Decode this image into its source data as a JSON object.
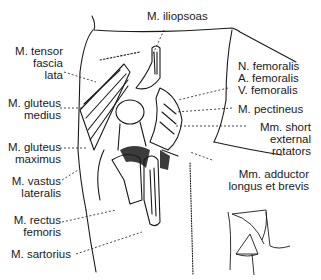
{
  "diagram": {
    "labels_left": [
      {
        "id": "tensor",
        "text": "M. tensor\nfascia\nlata"
      },
      {
        "id": "gluteus_medius",
        "text": "M. gluteus\nmedius"
      },
      {
        "id": "gluteus_maximus",
        "text": "M. gluteus\nmaximus"
      },
      {
        "id": "vastus_lateralis",
        "text": "M. vastus\nlateralis"
      },
      {
        "id": "rectus_femoris",
        "text": "M. rectus\nfemoris"
      },
      {
        "id": "sartorius",
        "text": "M. sartorius"
      }
    ],
    "labels_top": [
      {
        "id": "iliopsoas",
        "text": "M. iliopsoas"
      }
    ],
    "labels_right": [
      {
        "id": "femoral_bundle",
        "text": "N. femoralis\nA. femoralis\nV. femoralis"
      },
      {
        "id": "pectineus",
        "text": "M. pectineus"
      },
      {
        "id": "short_rotators",
        "text": "Mm. short\nexternal\nrotators"
      },
      {
        "id": "adductors",
        "text": "Mm. adductor\nlongus et brevis"
      }
    ],
    "inset": {
      "description": "orientation sketch of hip and thigh"
    },
    "colors": {
      "ink": "#1a1a1a",
      "background": "#ffffff"
    }
  }
}
